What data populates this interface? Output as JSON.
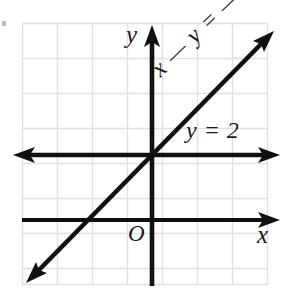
{
  "figure": {
    "kind": "coordinate-plane-diagram",
    "width": 291,
    "height": 291,
    "background_color": "#ffffff",
    "grid": {
      "visible": true,
      "color": "#e2e0e0",
      "spacing_px": 35,
      "x_start": 22,
      "x_end": 267,
      "y_start": 23,
      "y_end": 285,
      "columns": 7,
      "rows": 7.5
    },
    "axes": {
      "x_axis": {
        "label": "x",
        "y_px": 220,
        "from_px": 22,
        "to_px": 278,
        "arrow_left": false,
        "arrow_right": true,
        "color": "#111111"
      },
      "y_axis": {
        "label": "y",
        "x_px": 152,
        "from_px": 285,
        "to_px": 26,
        "arrow_top": true,
        "arrow_bottom": false,
        "color": "#111111"
      },
      "origin_label": "O"
    },
    "lines": [
      {
        "id": "horizontal-line",
        "label": "y = 2",
        "equation": "y = 2",
        "slope": 0,
        "y_intercept": 2,
        "y_px": 155,
        "from_px": 14,
        "to_px": 278,
        "arrow_left": true,
        "arrow_right": true,
        "color": "#111111"
      },
      {
        "id": "diagonal-line",
        "label": "x — y = —2",
        "equation": "x − y = −2",
        "slope": 1,
        "y_intercept": 2,
        "x1_px": 28,
        "y1_px": 281,
        "x2_px": 272,
        "y2_px": 33,
        "arrow_start": true,
        "arrow_end": true,
        "color": "#111111",
        "label_rotation_deg": -44
      }
    ],
    "intersection": {
      "description": "lines meet on the y-axis",
      "x_px": 152,
      "y_px": 155
    }
  }
}
